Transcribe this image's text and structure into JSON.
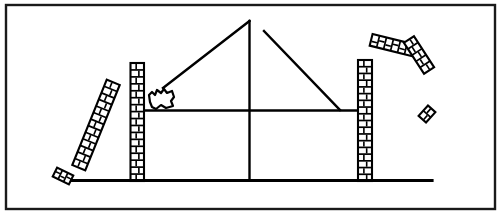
{
  "figure": {
    "domain": "diagram",
    "caption": "",
    "background_color": "#ffffff",
    "ink_color": "#000000"
  },
  "canvas": {
    "width": 501,
    "height": 215
  },
  "border": {
    "name": "figure-border",
    "x": 6,
    "y": 5,
    "width": 489,
    "height": 204,
    "stroke": "#1a1a1a",
    "stroke_width": 2.4,
    "fill": "none"
  },
  "ground": {
    "name": "ground-line",
    "x1": 72,
    "y1": 180.5,
    "x2": 432,
    "y2": 180.5,
    "stroke": "#000000",
    "stroke_width": 3.2
  },
  "beam": {
    "name": "horizontal-beam",
    "x1": 140,
    "y1": 110.5,
    "x2": 366,
    "y2": 110.5,
    "stroke": "#000000",
    "stroke_width": 2.6
  },
  "mast": {
    "name": "central-vertical-member",
    "x1": 249.5,
    "y1": 21,
    "x2": 249.5,
    "y2": 180,
    "stroke": "#000000",
    "stroke_width": 2.4
  },
  "braces": [
    {
      "name": "left-diagonal-brace",
      "x1": 249.5,
      "y1": 21,
      "x2": 163,
      "y2": 88,
      "stroke": "#000000",
      "stroke_width": 2.4
    },
    {
      "name": "right-diagonal-brace",
      "x1": 264,
      "y1": 31,
      "x2": 340,
      "y2": 110,
      "stroke": "#000000",
      "stroke_width": 2.4
    }
  ],
  "columns": [
    {
      "name": "left-brick-column",
      "label": "standing pier (left)",
      "x": 130.5,
      "y": 63,
      "width": 13.5,
      "height": 118,
      "rotation": 0,
      "courses": 17,
      "stroke": "#000000"
    },
    {
      "name": "right-brick-column",
      "label": "standing pier (right)",
      "x": 358,
      "y": 60,
      "width": 14,
      "height": 121,
      "rotation": 0,
      "courses": 18,
      "stroke": "#000000"
    }
  ],
  "falling_pieces": [
    {
      "name": "toppling-brick-pier",
      "label": "overturning pier (left)",
      "cx": 96,
      "cy": 125,
      "width": 14,
      "height": 92,
      "rotation": 22,
      "courses": 13
    },
    {
      "name": "flying-wall-fragment-upper-left",
      "label": "ejected wall fragment (upper)",
      "cx": 392,
      "cy": 45,
      "width": 12,
      "height": 43,
      "rotation": 104,
      "courses": 6
    },
    {
      "name": "flying-wall-fragment-upper-right",
      "label": "ejected wall fragment (lower)",
      "cx": 419,
      "cy": 55,
      "width": 12,
      "height": 37,
      "rotation": 147,
      "courses": 5
    },
    {
      "name": "brick-debris-ground-left",
      "label": "brick debris on ground",
      "cx": 63,
      "cy": 176,
      "width": 10,
      "height": 18,
      "rotation": 116,
      "courses": 3
    },
    {
      "name": "brick-debris-airborne-right",
      "label": "airborne brick debris",
      "cx": 427,
      "cy": 114,
      "width": 10,
      "height": 14,
      "rotation": 42,
      "courses": 2
    }
  ],
  "rubble_blob": {
    "name": "debris-blob",
    "label": "crushed masonry blob at brace foot",
    "cx": 161,
    "cy": 98,
    "stroke": "#000000",
    "stroke_width": 2.2
  }
}
